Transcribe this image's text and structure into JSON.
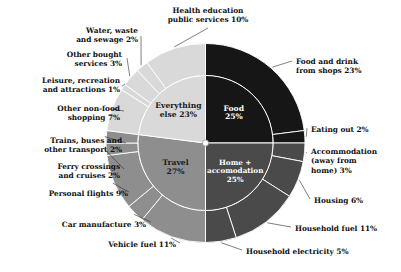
{
  "chart_data": {
    "type": "pie",
    "title": "",
    "subtitle": "",
    "xlabel": "",
    "ylabel": "",
    "legend_position": "none",
    "grid": false,
    "style": "nested donut (two concentric rings), start angle 12 o'clock, clockwise",
    "units": "percent of total footprint",
    "inner_ring": {
      "name": "Category",
      "categories": [
        "Food",
        "Home + accomodation",
        "Travel",
        "Everything else"
      ],
      "values": [
        25,
        25,
        27,
        23
      ],
      "labels": [
        "Food\n25%",
        "Home +\naccomodation\n25%",
        "Travel\n27%",
        "Everything\nelse 23%"
      ],
      "colors": [
        "#161616",
        "#4a4a4a",
        "#8e8e8e",
        "#d9d9d9"
      ],
      "label_colors": [
        "#ffffff",
        "#ffffff",
        "#1a1a1a",
        "#1a1a1a"
      ]
    },
    "outer_ring": {
      "name": "Sub-category",
      "categories": [
        "Food and drink from shops",
        "Eating out",
        "Accommodation (away from home)",
        "Housing",
        "Household fuel",
        "Household electricity",
        "Vehicle fuel",
        "Car manufacture",
        "Personal flights",
        "Ferry crossings and cruises",
        "Trains, buses and other transport",
        "Other non-food shopping",
        "Leisure, recreation and attractions",
        "Other bought services",
        "Water, waste and sewage",
        "Health education public services"
      ],
      "values": [
        23,
        2,
        3,
        6,
        11,
        5,
        11,
        3,
        9,
        2,
        2,
        7,
        1,
        3,
        2,
        10
      ],
      "colors": [
        "#161616",
        "#161616",
        "#4a4a4a",
        "#4a4a4a",
        "#4a4a4a",
        "#4a4a4a",
        "#8e8e8e",
        "#8e8e8e",
        "#8e8e8e",
        "#8e8e8e",
        "#8e8e8e",
        "#d9d9d9",
        "#d9d9d9",
        "#d9d9d9",
        "#d9d9d9",
        "#d9d9d9"
      ],
      "parent": [
        "Food",
        "Food",
        "Home + accomodation",
        "Home + accomodation",
        "Home + accomodation",
        "Home + accomodation",
        "Travel",
        "Travel",
        "Travel",
        "Travel",
        "Travel",
        "Everything else",
        "Everything else",
        "Everything else",
        "Everything else",
        "Everything else"
      ]
    },
    "callout_labels": [
      {
        "id": "food-and-drink-from-shops",
        "text": "Food and drink\nfrom shops 23%",
        "align": "left"
      },
      {
        "id": "eating-out",
        "text": "Eating out 2%",
        "align": "left"
      },
      {
        "id": "accommodation-away-from-home",
        "text": "Accommodation\n(away from\nhome) 3%",
        "align": "left"
      },
      {
        "id": "housing",
        "text": "Housing 6%",
        "align": "left"
      },
      {
        "id": "household-fuel",
        "text": "Household fuel 11%",
        "align": "left"
      },
      {
        "id": "household-electricity",
        "text": "Household electricity 5%",
        "align": "left"
      },
      {
        "id": "vehicle-fuel",
        "text": "Vehicle fuel 11%",
        "align": "right"
      },
      {
        "id": "car-manufacture",
        "text": "Car manufacture 3%",
        "align": "right"
      },
      {
        "id": "personal-flights",
        "text": "Personal flights 9%",
        "align": "right"
      },
      {
        "id": "ferry-crossings-and-cruises",
        "text": "Ferry crossings\nand cruises 2%",
        "align": "right"
      },
      {
        "id": "trains-buses-and-other-transport",
        "text": "Trains, buses and\nother transport 2%",
        "align": "right"
      },
      {
        "id": "other-non-food-shopping",
        "text": "Other non-food\nshopping 7%",
        "align": "right"
      },
      {
        "id": "leisure-recreation-and-attractions",
        "text": "Leisure, recreation\nand attractions 1%",
        "align": "right"
      },
      {
        "id": "other-bought-services",
        "text": "Other bought\nservices 3%",
        "align": "right"
      },
      {
        "id": "water-waste-and-sewage",
        "text": "Water, waste\nand sewage 2%",
        "align": "right"
      },
      {
        "id": "health-education-public-services",
        "text": "Health education\npublic services 10%",
        "align": "center"
      }
    ]
  },
  "labels": {
    "food_and_drink_from_shops": "Food and drink\nfrom shops 23%",
    "eating_out": "Eating out 2%",
    "accommodation": "Accommodation\n(away from\nhome) 3%",
    "housing": "Housing 6%",
    "household_fuel": "Household fuel 11%",
    "household_electricity": "Household electricity 5%",
    "vehicle_fuel": "Vehicle fuel 11%",
    "car_manufacture": "Car manufacture 3%",
    "personal_flights": "Personal flights 9%",
    "ferry_crossings": "Ferry crossings\nand cruises 2%",
    "trains_buses": "Trains, buses and\nother transport 2%",
    "other_non_food_shopping": "Other non-food\nshopping 7%",
    "leisure_recreation": "Leisure, recreation\nand attractions 1%",
    "other_bought_services": "Other bought\nservices 3%",
    "water_waste_sewage": "Water, waste\nand sewage 2%",
    "health_education": "Health education\npublic services 10%",
    "inner_food": "Food\n25%",
    "inner_home": "Home +\naccomodation\n25%",
    "inner_travel": "Travel\n27%",
    "inner_everything_else": "Everything\nelse 23%"
  }
}
